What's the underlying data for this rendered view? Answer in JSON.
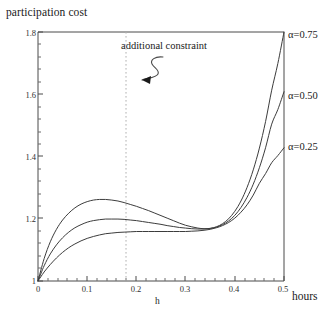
{
  "figure": {
    "y_axis_title": "participation cost",
    "x_axis_units": "hours",
    "x_axis_name": "h",
    "annotation": "additional constraint",
    "line_color": "#3c3c3c",
    "axis_color": "#4a4a4a",
    "guide_color": "#b0b0b0",
    "background": "#ffffff"
  },
  "chart_data": {
    "type": "line",
    "title": "participation cost",
    "xlabel": "h",
    "ylabel": "participation cost",
    "x_units": "hours",
    "xlim": [
      0,
      0.5
    ],
    "ylim": [
      1.0,
      1.8
    ],
    "grid": false,
    "legend_position": "right-inline-labels",
    "xticks": [
      "0",
      "0.1",
      "0.2",
      "0.3",
      "0.4",
      "0.5"
    ],
    "xtick_values": [
      0,
      0.1,
      0.2,
      0.3,
      0.4,
      0.5
    ],
    "yticks": [
      "1",
      "1.2",
      "1.4",
      "1.6",
      "1.8"
    ],
    "ytick_values": [
      1.0,
      1.2,
      1.4,
      1.6,
      1.8
    ],
    "annotations": [
      {
        "text": "additional constraint",
        "kind": "squiggle-arrow",
        "points_to_x": 0.18,
        "points_to_y": 1.62
      },
      {
        "kind": "vertical-dotted-line",
        "x": 0.18,
        "label": "additional constraint"
      }
    ],
    "x": [
      0,
      0.0125,
      0.025,
      0.0375,
      0.05,
      0.0625,
      0.075,
      0.0875,
      0.1,
      0.1125,
      0.125,
      0.1375,
      0.15,
      0.1625,
      0.175,
      0.1875,
      0.2,
      0.2125,
      0.225,
      0.2375,
      0.25,
      0.2625,
      0.275,
      0.2875,
      0.3,
      0.3125,
      0.325,
      0.3375,
      0.35,
      0.3625,
      0.375,
      0.3875,
      0.4,
      0.4125,
      0.425,
      0.4375,
      0.45,
      0.4625,
      0.475,
      0.4875,
      0.5
    ],
    "series": [
      {
        "name": "α=0.75",
        "label": "α=0.75",
        "alpha": 0.75,
        "peak_x": 0.13,
        "peak_y": 1.262,
        "end_y": 1.8,
        "values": [
          1.0,
          1.072,
          1.126,
          1.166,
          1.196,
          1.218,
          1.235,
          1.247,
          1.255,
          1.26,
          1.262,
          1.262,
          1.26,
          1.257,
          1.252,
          1.246,
          1.24,
          1.233,
          1.226,
          1.218,
          1.21,
          1.202,
          1.194,
          1.186,
          1.179,
          1.174,
          1.17,
          1.168,
          1.169,
          1.174,
          1.184,
          1.2,
          1.224,
          1.257,
          1.301,
          1.357,
          1.427,
          1.512,
          1.613,
          1.699,
          1.8
        ]
      },
      {
        "name": "α=0.50",
        "label": "α=0.50",
        "alpha": 0.5,
        "peak_x": 0.155,
        "peak_y": 1.199,
        "end_y": 1.608,
        "values": [
          1.0,
          1.049,
          1.087,
          1.116,
          1.139,
          1.157,
          1.171,
          1.181,
          1.189,
          1.194,
          1.197,
          1.199,
          1.199,
          1.199,
          1.198,
          1.196,
          1.194,
          1.191,
          1.188,
          1.185,
          1.182,
          1.178,
          1.175,
          1.172,
          1.17,
          1.168,
          1.167,
          1.167,
          1.169,
          1.173,
          1.181,
          1.193,
          1.211,
          1.236,
          1.269,
          1.311,
          1.364,
          1.428,
          1.504,
          1.551,
          1.608
        ]
      },
      {
        "name": "α=0.25",
        "label": "α=0.25",
        "alpha": 0.25,
        "peak_x": 0.23,
        "peak_y": 1.159,
        "end_y": 1.428,
        "values": [
          1.0,
          1.029,
          1.053,
          1.074,
          1.092,
          1.107,
          1.119,
          1.129,
          1.137,
          1.143,
          1.148,
          1.152,
          1.154,
          1.156,
          1.157,
          1.158,
          1.159,
          1.159,
          1.159,
          1.159,
          1.159,
          1.159,
          1.159,
          1.159,
          1.159,
          1.16,
          1.161,
          1.163,
          1.166,
          1.171,
          1.178,
          1.188,
          1.202,
          1.221,
          1.245,
          1.276,
          1.314,
          1.345,
          1.38,
          1.403,
          1.428
        ]
      }
    ]
  }
}
